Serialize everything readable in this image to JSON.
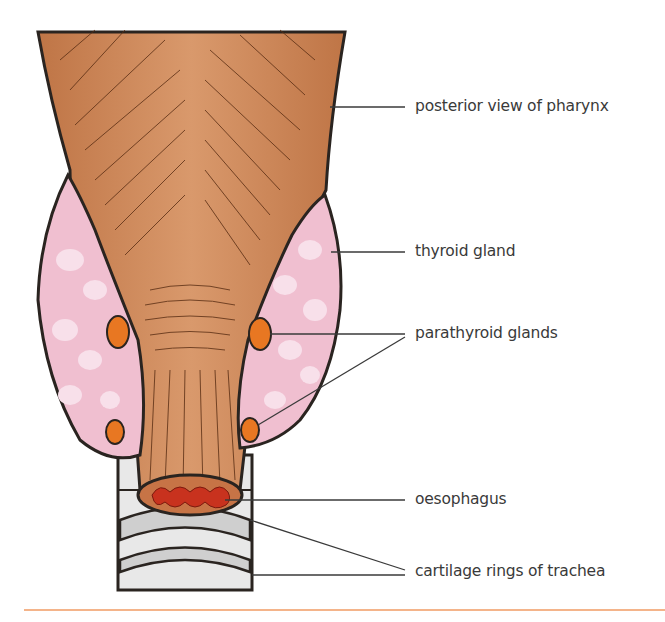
{
  "figure": {
    "labels": [
      {
        "id": "pharynx",
        "text": "posterior view of pharynx"
      },
      {
        "id": "thyroid",
        "text": "thyroid gland"
      },
      {
        "id": "parathyroid",
        "text": "parathyroid glands"
      },
      {
        "id": "oesophagus",
        "text": "oesophagus"
      },
      {
        "id": "trachea",
        "text": "cartilage rings of trachea"
      }
    ]
  },
  "colors": {
    "muscle": "#c27a4a",
    "muscle_light": "#d49466",
    "thyroid": "#f0bfd0",
    "thyroid_lobule": "#f8e0ea",
    "parathyroid": "#e87722",
    "oesophagus_lumen": "#c8321e",
    "cartilage": "#e6e6e6",
    "outline": "#2a2420",
    "leader": "#3a3a3a",
    "rule": "#f4b48a"
  }
}
